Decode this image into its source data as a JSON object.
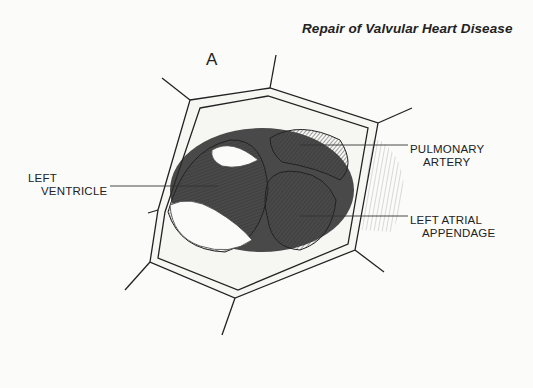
{
  "header": {
    "title": "Repair of Valvular Heart Disease"
  },
  "figure": {
    "panel_label": "A",
    "labels": [
      {
        "id": "left-ventricle",
        "line1": "LEFT",
        "line2": "VENTRICLE"
      },
      {
        "id": "pulmonary-artery",
        "line1": "PULMONARY",
        "line2": "ARTERY"
      },
      {
        "id": "left-atrial-appendage",
        "line1": "LEFT ATRIAL",
        "line2": "APPENDAGE"
      }
    ]
  },
  "colors": {
    "background": "#fbfbf9",
    "ink": "#1a1a1a"
  }
}
